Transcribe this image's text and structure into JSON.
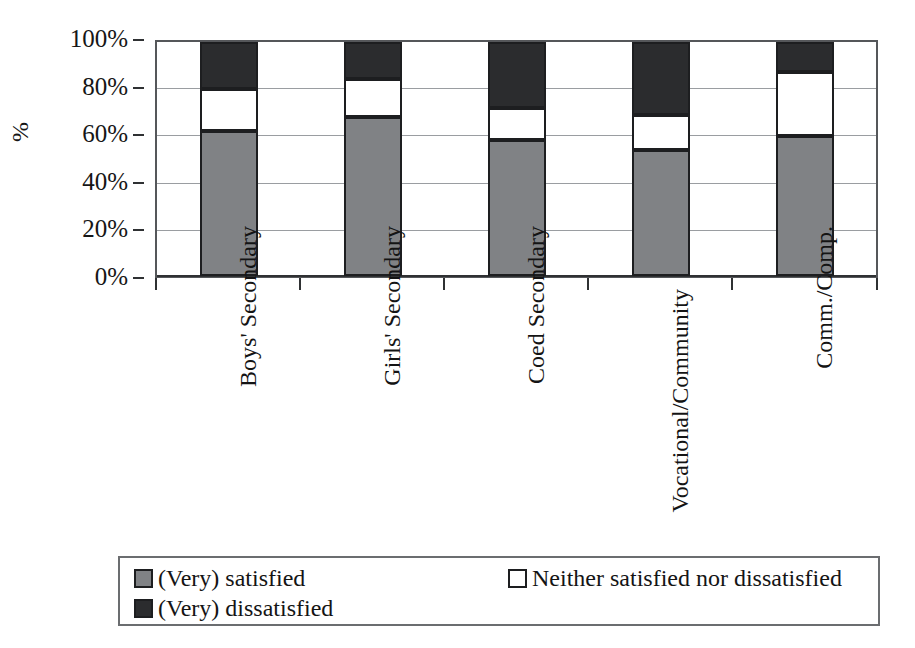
{
  "chart_data": {
    "type": "bar",
    "subtype": "stacked-100-percent",
    "title": "",
    "xlabel": "",
    "ylabel": "%",
    "ylim": [
      0,
      100
    ],
    "yticks": [
      "0%",
      "20%",
      "40%",
      "60%",
      "80%",
      "100%"
    ],
    "ytick_values": [
      0,
      20,
      40,
      60,
      80,
      100
    ],
    "grid": true,
    "legend_position": "bottom",
    "categories": [
      "Boys' Secondary",
      "Girls' Secondary",
      "Coed Secondary",
      "Vocational/Community",
      "Comm./Comp."
    ],
    "series": [
      {
        "name": "(Very) satisfied",
        "color": "#808285",
        "values": [
          62,
          68,
          58,
          54,
          60
        ]
      },
      {
        "name": "Neither satisfied nor dissatisfied",
        "color": "#ffffff",
        "values": [
          18,
          16,
          14,
          15,
          27
        ]
      },
      {
        "name": "(Very) dissatisfied",
        "color": "#2b2c2e",
        "values": [
          20,
          16,
          28,
          31,
          13
        ]
      }
    ]
  },
  "axis": {
    "y_title": "%",
    "ticks": [
      "100%",
      "80%",
      "60%",
      "40%",
      "20%",
      "0%"
    ]
  },
  "legend": {
    "items": [
      {
        "label": "(Very) satisfied",
        "swatch": "#808285"
      },
      {
        "label": "Neither satisfied nor dissatisfied",
        "swatch": "#ffffff"
      },
      {
        "label": "(Very) dissatisfied",
        "swatch": "#2b2c2e"
      }
    ]
  },
  "categories": {
    "labels": [
      "Boys' Secondary",
      "Girls' Secondary",
      "Coed Secondary",
      "Vocational/Community",
      "Comm./Comp."
    ]
  }
}
